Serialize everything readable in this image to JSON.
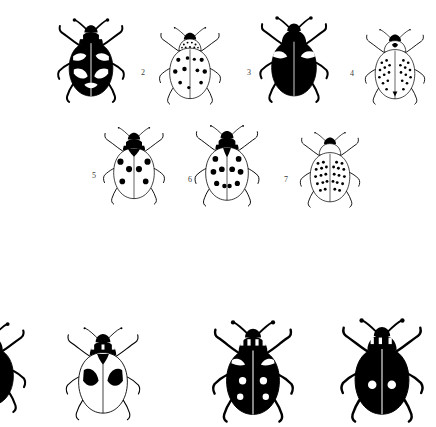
{
  "plate": {
    "title": "Ladybird beetle identification plate",
    "description": "Black-and-white line illustrations of ladybird beetles (Coccinellidae) arranged in rows, each dorsal view with legs and antennae extended.",
    "background_color": "#ffffff",
    "ink_color": "#000000",
    "figure_number_color": "#3a3a3a",
    "width": 436,
    "height": 427
  },
  "rows": [
    {
      "name": "row-1",
      "figures": [
        {
          "number": "",
          "name": "beetle-1",
          "pattern": "black elytra with pale irregular bands and spots",
          "body_fill": "#000000",
          "marking_fill": "#ffffff",
          "x": 55,
          "y": 18,
          "w": 72,
          "h": 86,
          "label_x": 0,
          "label_y": 0,
          "label_size": 0
        },
        {
          "number": "2",
          "name": "beetle-2",
          "pattern": "pale elytra with large scattered black spots, speckled pronotum",
          "body_fill": "#ffffff",
          "marking_fill": "#000000",
          "x": 157,
          "y": 26,
          "w": 66,
          "h": 80,
          "label_x": 141,
          "label_y": 69,
          "label_size": 8
        },
        {
          "number": "3",
          "name": "beetle-3",
          "pattern": "entirely black elytra with pale shoulder notches",
          "body_fill": "#000000",
          "marking_fill": "#ffffff",
          "x": 258,
          "y": 16,
          "w": 72,
          "h": 88,
          "label_x": 247,
          "label_y": 69,
          "label_size": 8
        },
        {
          "number": "4",
          "name": "beetle-4",
          "pattern": "pale elytra densely covered with small black spots",
          "body_fill": "#ffffff",
          "marking_fill": "#000000",
          "x": 364,
          "y": 28,
          "w": 62,
          "h": 78,
          "label_x": 350,
          "label_y": 70,
          "label_size": 8
        }
      ]
    },
    {
      "name": "row-2",
      "figures": [
        {
          "number": "5",
          "name": "beetle-5",
          "pattern": "pale elytra with large round black spots and black pronotum",
          "body_fill": "#ffffff",
          "marking_fill": "#000000",
          "x": 101,
          "y": 126,
          "w": 66,
          "h": 80,
          "label_x": 92,
          "label_y": 172,
          "label_size": 8
        },
        {
          "number": "6",
          "name": "beetle-6",
          "pattern": "pale elytra with ten bold black spots, black head and pronotum",
          "body_fill": "#ffffff",
          "marking_fill": "#000000",
          "x": 192,
          "y": 124,
          "w": 70,
          "h": 84,
          "label_x": 188,
          "label_y": 176,
          "label_size": 8
        },
        {
          "number": "7",
          "name": "beetle-7",
          "pattern": "pale elytra with many small black spots in rows",
          "body_fill": "#ffffff",
          "marking_fill": "#000000",
          "x": 298,
          "y": 131,
          "w": 64,
          "h": 78,
          "label_x": 284,
          "label_y": 176,
          "label_size": 8
        }
      ]
    },
    {
      "name": "row-3",
      "figures": [
        {
          "number": "",
          "name": "beetle-8-cropped",
          "pattern": "partially visible at the left edge; only legs and antennae show",
          "body_fill": "#000000",
          "marking_fill": "#ffffff",
          "x": -46,
          "y": 322,
          "w": 72,
          "h": 92,
          "label_x": 0,
          "label_y": 0,
          "label_size": 0
        },
        {
          "number": "",
          "name": "beetle-9",
          "pattern": "pale elytra with two large black triangular blotches, black pronotum",
          "body_fill": "#ffffff",
          "marking_fill": "#000000",
          "x": 65,
          "y": 326,
          "w": 76,
          "h": 96,
          "label_x": 0,
          "label_y": 0,
          "label_size": 0
        },
        {
          "number": "",
          "name": "beetle-10",
          "pattern": "black elytra with four white spots and pale shoulder marks",
          "body_fill": "#000000",
          "marking_fill": "#ffffff",
          "x": 212,
          "y": 320,
          "w": 82,
          "h": 104,
          "label_x": 0,
          "label_y": 0,
          "label_size": 0
        },
        {
          "number": "",
          "name": "beetle-11",
          "pattern": "black elytra with two white spots",
          "body_fill": "#000000",
          "marking_fill": "#ffffff",
          "x": 340,
          "y": 318,
          "w": 84,
          "h": 106,
          "label_x": 0,
          "label_y": 0,
          "label_size": 0
        }
      ]
    }
  ]
}
